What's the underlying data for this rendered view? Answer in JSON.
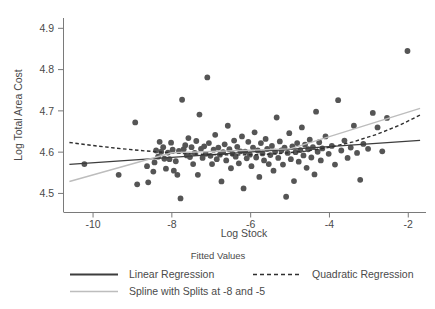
{
  "chart_data": {
    "type": "scatter",
    "title": "",
    "xlabel": "Log Stock",
    "ylabel": "Log Total Area Cost",
    "xlim": [
      -10.75,
      -1.55
    ],
    "ylim": [
      4.455,
      4.925
    ],
    "xticks": [
      -10,
      -8,
      -6,
      -4,
      -2
    ],
    "xtick_labels": [
      "-10",
      "-8",
      "-6",
      "-4",
      "-2"
    ],
    "yticks": [
      4.5,
      4.6,
      4.7,
      4.8,
      4.9
    ],
    "ytick_labels": [
      "4.5",
      "4.6",
      "4.7",
      "4.8",
      "4.9"
    ],
    "grid": false,
    "legend_position": "bottom",
    "legend_title": "Fitted Values",
    "marker_color": "#555555",
    "series": [
      {
        "name": "Scatter",
        "type": "scatter",
        "points": [
          [
            -10.22,
            4.571
          ],
          [
            -9.35,
            4.545
          ],
          [
            -8.93,
            4.672
          ],
          [
            -8.88,
            4.522
          ],
          [
            -8.63,
            4.566
          ],
          [
            -8.6,
            4.527
          ],
          [
            -8.47,
            4.553
          ],
          [
            -8.44,
            4.575
          ],
          [
            -8.4,
            4.604
          ],
          [
            -8.35,
            4.589
          ],
          [
            -8.31,
            4.625
          ],
          [
            -8.27,
            4.601
          ],
          [
            -8.22,
            4.612
          ],
          [
            -8.19,
            4.584
          ],
          [
            -8.15,
            4.56
          ],
          [
            -8.1,
            4.599
          ],
          [
            -8.06,
            4.583
          ],
          [
            -8.02,
            4.623
          ],
          [
            -7.98,
            4.606
          ],
          [
            -7.95,
            4.555
          ],
          [
            -7.9,
            4.578
          ],
          [
            -7.86,
            4.545
          ],
          [
            -7.82,
            4.603
          ],
          [
            -7.78,
            4.488
          ],
          [
            -7.74,
            4.727
          ],
          [
            -7.7,
            4.607
          ],
          [
            -7.66,
            4.617
          ],
          [
            -7.62,
            4.592
          ],
          [
            -7.58,
            4.634
          ],
          [
            -7.54,
            4.588
          ],
          [
            -7.5,
            4.612
          ],
          [
            -7.46,
            4.571
          ],
          [
            -7.42,
            4.598
          ],
          [
            -7.38,
            4.627
          ],
          [
            -7.34,
            4.545
          ],
          [
            -7.3,
            4.691
          ],
          [
            -7.26,
            4.608
          ],
          [
            -7.22,
            4.586
          ],
          [
            -7.18,
            4.614
          ],
          [
            -7.14,
            4.596
          ],
          [
            -7.1,
            4.781
          ],
          [
            -7.06,
            4.622
          ],
          [
            -7.02,
            4.591
          ],
          [
            -6.98,
            4.571
          ],
          [
            -6.94,
            4.606
          ],
          [
            -6.9,
            4.642
          ],
          [
            -6.86,
            4.583
          ],
          [
            -6.82,
            4.611
          ],
          [
            -6.78,
            4.594
          ],
          [
            -6.74,
            4.529
          ],
          [
            -6.7,
            4.6
          ],
          [
            -6.66,
            4.619
          ],
          [
            -6.62,
            4.58
          ],
          [
            -6.58,
            4.664
          ],
          [
            -6.54,
            4.607
          ],
          [
            -6.5,
            4.561
          ],
          [
            -6.46,
            4.596
          ],
          [
            -6.42,
            4.628
          ],
          [
            -6.38,
            4.589
          ],
          [
            -6.34,
            4.613
          ],
          [
            -6.3,
            4.573
          ],
          [
            -6.26,
            4.602
          ],
          [
            -6.22,
            4.638
          ],
          [
            -6.18,
            4.512
          ],
          [
            -6.14,
            4.601
          ],
          [
            -6.1,
            4.585
          ],
          [
            -6.06,
            4.625
          ],
          [
            -6.02,
            4.594
          ],
          [
            -5.98,
            4.566
          ],
          [
            -5.94,
            4.611
          ],
          [
            -5.9,
            4.648
          ],
          [
            -5.86,
            4.587
          ],
          [
            -5.82,
            4.604
          ],
          [
            -5.78,
            4.54
          ],
          [
            -5.74,
            4.622
          ],
          [
            -5.7,
            4.597
          ],
          [
            -5.66,
            4.58
          ],
          [
            -5.62,
            4.632
          ],
          [
            -5.58,
            4.608
          ],
          [
            -5.54,
            4.571
          ],
          [
            -5.5,
            4.593
          ],
          [
            -5.46,
            4.615
          ],
          [
            -5.42,
            4.555
          ],
          [
            -5.38,
            4.601
          ],
          [
            -5.34,
            4.684
          ],
          [
            -5.3,
            4.586
          ],
          [
            -5.26,
            4.626
          ],
          [
            -5.22,
            4.604
          ],
          [
            -5.18,
            4.57
          ],
          [
            -5.14,
            4.611
          ],
          [
            -5.1,
            4.492
          ],
          [
            -5.06,
            4.598
          ],
          [
            -5.02,
            4.646
          ],
          [
            -4.98,
            4.583
          ],
          [
            -4.94,
            4.614
          ],
          [
            -4.9,
            4.53
          ],
          [
            -4.86,
            4.6
          ],
          [
            -4.82,
            4.622
          ],
          [
            -4.78,
            4.577
          ],
          [
            -4.74,
            4.605
          ],
          [
            -4.7,
            4.66
          ],
          [
            -4.66,
            4.592
          ],
          [
            -4.62,
            4.618
          ],
          [
            -4.58,
            4.562
          ],
          [
            -4.54,
            4.607
          ],
          [
            -4.5,
            4.63
          ],
          [
            -4.46,
            4.587
          ],
          [
            -4.42,
            4.612
          ],
          [
            -4.38,
            4.546
          ],
          [
            -4.34,
            4.698
          ],
          [
            -4.3,
            4.601
          ],
          [
            -4.26,
            4.624
          ],
          [
            -4.22,
            4.58
          ],
          [
            -4.18,
            4.609
          ],
          [
            -4.1,
            4.638
          ],
          [
            -4.02,
            4.596
          ],
          [
            -3.94,
            4.615
          ],
          [
            -3.86,
            4.57
          ],
          [
            -3.78,
            4.726
          ],
          [
            -3.7,
            4.604
          ],
          [
            -3.62,
            4.628
          ],
          [
            -3.54,
            4.586
          ],
          [
            -3.46,
            4.611
          ],
          [
            -3.38,
            4.664
          ],
          [
            -3.3,
            4.598
          ],
          [
            -3.22,
            4.533
          ],
          [
            -3.14,
            4.62
          ],
          [
            -3.02,
            4.608
          ],
          [
            -2.9,
            4.695
          ],
          [
            -2.78,
            4.66
          ],
          [
            -2.66,
            4.602
          ],
          [
            -2.54,
            4.683
          ],
          [
            -2.02,
            4.845
          ]
        ]
      },
      {
        "name": "Linear Regression",
        "type": "line",
        "style": "solid",
        "color": "#3d3d3d",
        "width": 1.4,
        "points": [
          [
            -10.6,
            4.5705
          ],
          [
            -1.7,
            4.6285
          ]
        ]
      },
      {
        "name": "Quadratic Regression",
        "type": "line",
        "style": "dashed",
        "color": "#2f2f2f",
        "width": 1.4,
        "points": [
          [
            -10.6,
            4.6235
          ],
          [
            -10.0,
            4.616
          ],
          [
            -9.4,
            4.6095
          ],
          [
            -8.8,
            4.604
          ],
          [
            -8.2,
            4.5995
          ],
          [
            -7.6,
            4.5962
          ],
          [
            -7.0,
            4.594
          ],
          [
            -6.4,
            4.5932
          ],
          [
            -5.8,
            4.594
          ],
          [
            -5.2,
            4.597
          ],
          [
            -4.6,
            4.6025
          ],
          [
            -4.0,
            4.6115
          ],
          [
            -3.4,
            4.625
          ],
          [
            -2.8,
            4.643
          ],
          [
            -2.2,
            4.666
          ],
          [
            -1.7,
            4.69
          ]
        ]
      },
      {
        "name": "Spline with Splits at -8 and -5",
        "type": "line",
        "style": "solid",
        "color": "#bdbdbd",
        "width": 1.4,
        "points": [
          [
            -10.6,
            4.529
          ],
          [
            -8.0,
            4.5985
          ],
          [
            -5.0,
            4.608
          ],
          [
            -1.7,
            4.706
          ]
        ]
      }
    ],
    "legend_entries": [
      {
        "label": "Linear Regression",
        "style": "solid",
        "color": "#3d3d3d"
      },
      {
        "label": "Quadratic Regression",
        "style": "dashed",
        "color": "#2f2f2f"
      },
      {
        "label": "Spline with Splits at -8 and -5",
        "style": "solid",
        "color": "#bdbdbd"
      }
    ]
  }
}
